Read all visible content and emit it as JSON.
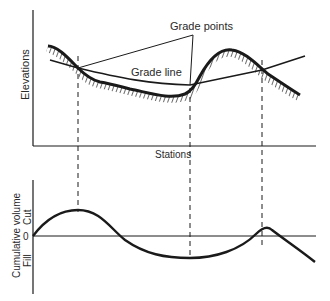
{
  "upper_chart": {
    "y_axis_label": "Elevations",
    "x_axis_label": "Stations",
    "annotations": {
      "grade_points": "Grade points",
      "grade_line": "Grade line"
    }
  },
  "lower_chart": {
    "y_axis_label": "Cumulative volume",
    "cut_label": "Cut",
    "fill_label": "Fill",
    "zero_label": "0"
  },
  "colors": {
    "ink": "#1a1a1a",
    "background": "#ffffff"
  }
}
